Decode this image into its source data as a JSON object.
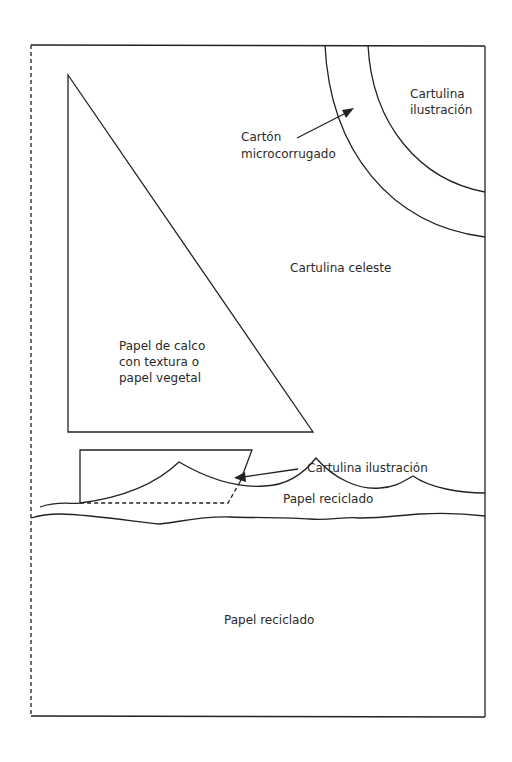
{
  "diagram": {
    "labels": {
      "cartulina_ilustracion_top_1": "Cartulina",
      "cartulina_ilustracion_top_2": "ilustración",
      "carton_1": "Cartón",
      "carton_2": "microcorrugado",
      "cartulina_celeste": "Cartulina celeste",
      "calco_1": "Papel de calco",
      "calco_2": "con textura o",
      "calco_3": "papel vegetal",
      "cartulina_ilustracion_bottom": "Cartulina ilustración",
      "papel_reciclado_upper": "Papel reciclado",
      "papel_reciclado_lower": "Papel reciclado"
    },
    "colors": {
      "stroke": "#222222",
      "background": "#ffffff",
      "text": "#2a2a2a"
    }
  }
}
